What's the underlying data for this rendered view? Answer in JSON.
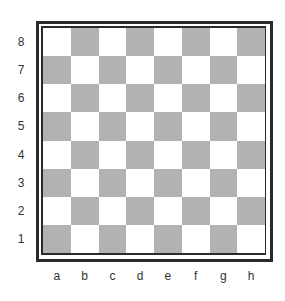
{
  "board": {
    "ranks": [
      "8",
      "7",
      "6",
      "5",
      "4",
      "3",
      "2",
      "1"
    ],
    "files": [
      "a",
      "b",
      "c",
      "d",
      "e",
      "f",
      "g",
      "h"
    ],
    "colors": {
      "light": "#ffffff",
      "dark": "#b2b2b2",
      "border": "#2a2a2a"
    },
    "pieces": []
  }
}
